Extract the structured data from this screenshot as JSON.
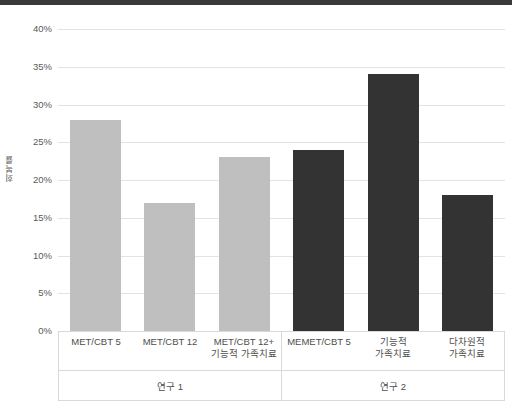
{
  "chart_data": {
    "type": "bar",
    "title": "",
    "subtitle": "",
    "xlabel": "",
    "ylabel": "회복률",
    "ylim": [
      0,
      40
    ],
    "ytick_labels": [
      "40%",
      "35%",
      "30%",
      "25%",
      "20%",
      "15%",
      "10%",
      "5%",
      "0%"
    ],
    "ytick_values": [
      40,
      35,
      30,
      25,
      20,
      15,
      10,
      5,
      0
    ],
    "grid": true,
    "legend": "none",
    "categories": [
      "MET/CBT 5",
      "MET/CBT 12",
      "MET/CBT 12+\n기능적 가족치료",
      "MEMET/CBT 5",
      "기능적\n가족치료",
      "다차원적\n가족치료"
    ],
    "values": [
      28,
      17,
      23,
      24,
      34,
      18
    ],
    "bar_colors": [
      "#bfbfbf",
      "#bfbfbf",
      "#bfbfbf",
      "#333333",
      "#333333",
      "#333333"
    ],
    "groups": [
      {
        "label": "연구 1",
        "count": 3,
        "color": "#bfbfbf"
      },
      {
        "label": "연구 2",
        "count": 3,
        "color": "#333333"
      }
    ]
  },
  "colors": {
    "light_bar": "#bfbfbf",
    "dark_bar": "#333333",
    "gridline": "#e3e3e3",
    "axis_text": "#5a5a5a",
    "border": "#d9d9d9",
    "top_strip": "#3a3a3a",
    "background": "#ffffff"
  }
}
